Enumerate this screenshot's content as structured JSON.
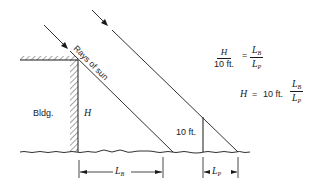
{
  "diagram": {
    "labels": {
      "rays": "Rays of sun",
      "building": "Bldg.",
      "height": "H",
      "pole_height": "10 ft.",
      "lb_main": "L",
      "lb_sub": "B",
      "lp_main": "L",
      "lp_sub": "P"
    },
    "equation1": {
      "lhs_num": "H",
      "lhs_den": "10 ft.",
      "equals": "=",
      "rhs_num_main": "L",
      "rhs_num_sub": "B",
      "rhs_den_main": "L",
      "rhs_den_sub": "P"
    },
    "equation2": {
      "lhs": "H",
      "equals": "=",
      "coef": "10 ft.",
      "num_main": "L",
      "num_sub": "B",
      "den_main": "L",
      "den_sub": "P"
    }
  }
}
